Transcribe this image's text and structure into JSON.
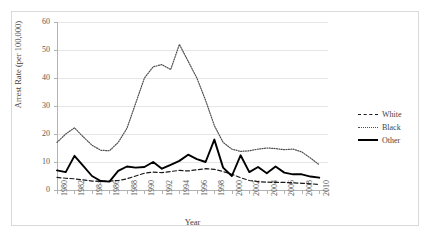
{
  "chart_data": {
    "type": "line",
    "title": "",
    "subtitle": "",
    "xlabel": "Year",
    "ylabel": "Arrest Rate (per 100,000)",
    "xlim": [
      1980,
      2011
    ],
    "ylim": [
      0,
      60
    ],
    "ytick_values": [
      0,
      10,
      20,
      30,
      40,
      50,
      60
    ],
    "ytick_labels": [
      "0",
      "10",
      "20",
      "30",
      "40",
      "50",
      "60"
    ],
    "xtick_values": [
      1980,
      1982,
      1984,
      1986,
      1988,
      1990,
      1992,
      1994,
      1996,
      1998,
      2000,
      2002,
      2004,
      2006,
      2008,
      2010
    ],
    "xtick_labels": [
      "1980",
      "1982",
      "1984",
      "1986",
      "1988",
      "1990",
      "1992",
      "1994",
      "1996",
      "1998",
      "2000",
      "2002",
      "2004",
      "2006",
      "2008",
      "2010"
    ],
    "grid": "horizontal",
    "legend_position": "right",
    "x": [
      1980,
      1981,
      1982,
      1983,
      1984,
      1985,
      1986,
      1987,
      1988,
      1989,
      1990,
      1991,
      1992,
      1993,
      1994,
      1995,
      1996,
      1997,
      1998,
      1999,
      2000,
      2001,
      2002,
      2003,
      2004,
      2005,
      2006,
      2007,
      2008,
      2009,
      2010
    ],
    "series": [
      {
        "name": "White",
        "style": "dashed",
        "color": "#1a1a1a",
        "values": [
          4.5,
          4.2,
          4.0,
          3.6,
          3.2,
          3.1,
          3.2,
          3.4,
          4.0,
          5.0,
          6.0,
          6.4,
          6.2,
          6.6,
          7.0,
          6.8,
          7.2,
          7.6,
          7.4,
          6.6,
          5.6,
          4.4,
          3.4,
          3.0,
          2.8,
          2.7,
          2.7,
          2.6,
          2.4,
          2.2,
          2.0
        ]
      },
      {
        "name": "Black",
        "style": "dotted",
        "color": "#4d4d4d",
        "values": [
          17.0,
          20.0,
          22.2,
          19.0,
          16.0,
          14.2,
          14.0,
          17.0,
          22.0,
          31.0,
          40.0,
          44.0,
          44.8,
          43.0,
          52.0,
          46.0,
          40.0,
          32.0,
          23.0,
          17.0,
          14.6,
          13.8,
          14.0,
          14.6,
          15.0,
          14.8,
          14.4,
          14.6,
          13.6,
          11.4,
          9.0
        ]
      },
      {
        "name": "Other",
        "style": "solid",
        "color": "#000000",
        "values": [
          7.0,
          6.4,
          12.2,
          8.6,
          5.0,
          3.2,
          3.0,
          6.8,
          8.4,
          8.0,
          8.2,
          10.0,
          7.6,
          9.0,
          10.4,
          12.6,
          11.0,
          10.0,
          18.0,
          8.0,
          5.0,
          12.4,
          6.4,
          8.2,
          6.0,
          8.4,
          6.2,
          5.6,
          5.6,
          4.8,
          4.4
        ]
      }
    ]
  },
  "legend": {
    "items": [
      {
        "label": "White"
      },
      {
        "label": "Black"
      },
      {
        "label": "Other"
      }
    ]
  }
}
